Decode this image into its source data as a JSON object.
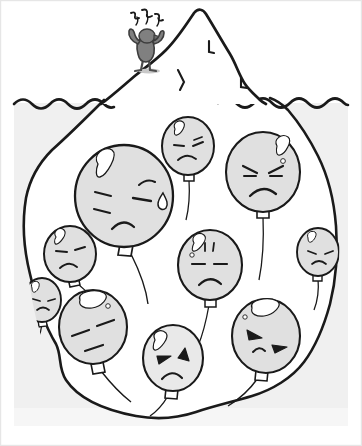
{
  "image": {
    "title": "Iceberg of emotions",
    "width": 362,
    "height": 446,
    "style": "hand-drawn line art, grayscale"
  },
  "palette": {
    "background": "#ffffff",
    "ink": "#1a1a1a",
    "water": "#f0f0f0",
    "iceberg_above": "#ffffff",
    "iceberg_below": "#ffffff",
    "balloon_fill": "#e0e0e0",
    "balloon_fill_light": "#e8e8e8",
    "highlight": "#ffffff",
    "figure_body": "#808080",
    "figure_dark": "#4d4d4d",
    "frame": "#e6e6e6"
  },
  "scene": {
    "waterline_label": "waterline",
    "above_water_label": "visible tip",
    "below_water_label": "submerged mass"
  },
  "figure": {
    "name": "stressed-person",
    "pose": "arms raised, standing on iceberg tip",
    "stress_marks": "~~~",
    "stress_mark_count": 3,
    "position": {
      "x": 145,
      "y": 48
    }
  },
  "iceberg": {
    "tip_peak": {
      "x": 196,
      "y": 12
    },
    "crack_marks": 3
  },
  "balloons": [
    {
      "id": "balloon-1",
      "label": "large crying balloon",
      "emotion": "sad-crying",
      "cx": 124,
      "cy": 196,
      "rx": 48,
      "ry": 50,
      "has_tear": true,
      "eyes": "slanted-sad",
      "mouth": "frown",
      "string_dir": "right-down"
    },
    {
      "id": "balloon-2",
      "label": "top center balloon",
      "emotion": "annoyed",
      "cx": 188,
      "cy": 146,
      "rx": 25,
      "ry": 28,
      "has_tear": false,
      "eyes": "slanted-annoyed",
      "mouth": "frown",
      "string_dir": "down"
    },
    {
      "id": "balloon-3",
      "label": "top right angry balloon",
      "emotion": "angry",
      "cx": 263,
      "cy": 172,
      "rx": 36,
      "ry": 40,
      "has_tear": false,
      "eyes": "angry-brows",
      "mouth": "deep-frown",
      "string_dir": "down"
    },
    {
      "id": "balloon-4",
      "label": "left small balloon",
      "emotion": "unhappy",
      "cx": 70,
      "cy": 254,
      "rx": 25,
      "ry": 27,
      "has_tear": false,
      "eyes": "flat-slanted",
      "mouth": "small-frown",
      "string_dir": "right-down"
    },
    {
      "id": "balloon-5",
      "label": "center balloon",
      "emotion": "displeased",
      "cx": 210,
      "cy": 265,
      "rx": 31,
      "ry": 35,
      "has_tear": false,
      "eyes": "flat-lines",
      "mouth": "frown",
      "string_dir": "down-left"
    },
    {
      "id": "balloon-6",
      "label": "lower left balloon",
      "emotion": "weary",
      "cx": 93,
      "cy": 327,
      "rx": 33,
      "ry": 37,
      "has_tear": false,
      "eyes": "half-closed",
      "mouth": "flat-slant",
      "string_dir": "down-right"
    },
    {
      "id": "balloon-7",
      "label": "bottom center angry balloon",
      "emotion": "angry",
      "cx": 173,
      "cy": 358,
      "rx": 29,
      "ry": 32,
      "has_tear": false,
      "eyes": "solid-angry",
      "mouth": "frown",
      "string_dir": "down-left"
    },
    {
      "id": "balloon-8",
      "label": "bottom right balloon",
      "emotion": "grumpy",
      "cx": 266,
      "cy": 336,
      "rx": 33,
      "ry": 36,
      "has_tear": false,
      "eyes": "solid-angry",
      "mouth": "small-frown",
      "string_dir": "down-left"
    },
    {
      "id": "balloon-9",
      "label": "right edge balloon upper",
      "emotion": "frustrated",
      "cx": 318,
      "cy": 252,
      "rx": 20,
      "ry": 24,
      "has_tear": false,
      "eyes": "slanted",
      "mouth": "frown",
      "string_dir": "down"
    },
    {
      "id": "balloon-10",
      "label": "left edge partial balloon",
      "emotion": "sad",
      "cx": 42,
      "cy": 300,
      "rx": 18,
      "ry": 22,
      "has_tear": false,
      "eyes": "slanted",
      "mouth": "frown",
      "string_dir": "down"
    }
  ]
}
